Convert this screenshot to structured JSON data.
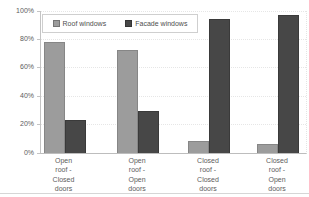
{
  "chart_data": {
    "type": "bar",
    "categories": [
      "Open roof - Closed doors",
      "Open roof - Open doors",
      "Closed roof - Closed doors",
      "Closed roof - Open doors"
    ],
    "categories_display": [
      "Open\nroof -\nClosed\ndoors",
      "Open\nroof -\nOpen\ndoors",
      "Closed\nroof -\nClosed\ndoors",
      "Closed\nroof -\nOpen\ndoors"
    ],
    "series": [
      {
        "name": "Roof windows",
        "color": "#9c9c9c",
        "values": [
          78,
          72,
          8,
          6
        ]
      },
      {
        "name": "Facade windows",
        "color": "#474747",
        "values": [
          23,
          29,
          94,
          97
        ]
      }
    ],
    "title": "",
    "xlabel": "",
    "ylabel": "",
    "ylim": [
      0,
      100
    ],
    "yticks": [
      {
        "value": 0,
        "label": "0%"
      },
      {
        "value": 20,
        "label": "20%"
      },
      {
        "value": 40,
        "label": "40%"
      },
      {
        "value": 60,
        "label": "60%"
      },
      {
        "value": 80,
        "label": "80%"
      },
      {
        "value": 100,
        "label": "100%"
      }
    ],
    "grid": "horizontal-dotted",
    "legend_position": "top-inside-left"
  },
  "colors": {
    "background": "#ffffff",
    "axis": "#c4c4c4",
    "gridline": "#e6e6e6",
    "text": "#5c5c5c",
    "roof_bar": "#9c9c9c",
    "facade_bar": "#474747"
  }
}
